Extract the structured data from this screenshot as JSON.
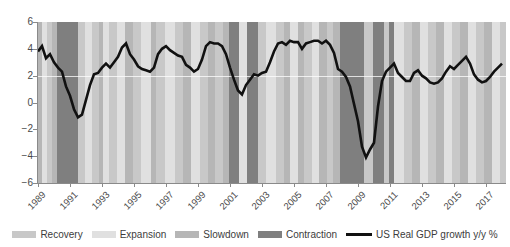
{
  "chart_data": {
    "type": "line",
    "title": "",
    "subtitle": "",
    "xlabel": "",
    "ylabel": "",
    "xlim": [
      1989.0,
      2018.25
    ],
    "ylim": [
      -6,
      6
    ],
    "yticks": [
      6,
      4,
      2,
      0,
      -2,
      -4,
      -6
    ],
    "ytick_labels": [
      "6",
      "4",
      "2",
      "0",
      "-2",
      "-4",
      "-6"
    ],
    "xticks": [
      1989,
      1991,
      1993,
      1995,
      1997,
      1999,
      2001,
      2003,
      2005,
      2007,
      2009,
      2011,
      2013,
      2015,
      2017
    ],
    "xtick_labels": [
      "1989",
      "1991",
      "1993",
      "1995",
      "1997",
      "1999",
      "2001",
      "2003",
      "2005",
      "2007",
      "2009",
      "2011",
      "2013",
      "2015",
      "2017"
    ],
    "grid": "horizontal-gridline-at-2-only",
    "legend_position": "bottom-center",
    "series": [
      {
        "name": "US Real GDP growth y/y %",
        "color": "#111111",
        "x": [
          1989.0,
          1989.25,
          1989.5,
          1989.75,
          1990.0,
          1990.25,
          1990.5,
          1990.75,
          1991.0,
          1991.25,
          1991.5,
          1991.75,
          1992.0,
          1992.25,
          1992.5,
          1992.75,
          1993.0,
          1993.25,
          1993.5,
          1993.75,
          1994.0,
          1994.25,
          1994.5,
          1994.75,
          1995.0,
          1995.25,
          1995.5,
          1995.75,
          1996.0,
          1996.25,
          1996.5,
          1996.75,
          1997.0,
          1997.25,
          1997.5,
          1997.75,
          1998.0,
          1998.25,
          1998.5,
          1998.75,
          1999.0,
          1999.25,
          1999.5,
          1999.75,
          2000.0,
          2000.25,
          2000.5,
          2000.75,
          2001.0,
          2001.25,
          2001.5,
          2001.75,
          2002.0,
          2002.25,
          2002.5,
          2002.75,
          2003.0,
          2003.25,
          2003.5,
          2003.75,
          2004.0,
          2004.25,
          2004.5,
          2004.75,
          2005.0,
          2005.25,
          2005.5,
          2005.75,
          2006.0,
          2006.25,
          2006.5,
          2006.75,
          2007.0,
          2007.25,
          2007.5,
          2007.75,
          2008.0,
          2008.25,
          2008.5,
          2008.75,
          2009.0,
          2009.25,
          2009.5,
          2009.75,
          2010.0,
          2010.25,
          2010.5,
          2010.75,
          2011.0,
          2011.25,
          2011.5,
          2011.75,
          2012.0,
          2012.25,
          2012.5,
          2012.75,
          2013.0,
          2013.25,
          2013.5,
          2013.75,
          2014.0,
          2014.25,
          2014.5,
          2014.75,
          2015.0,
          2015.25,
          2015.5,
          2015.75,
          2016.0,
          2016.25,
          2016.5,
          2016.75,
          2017.0,
          2017.25,
          2017.5,
          2017.75,
          2018.0
        ],
        "y": [
          3.8,
          4.2,
          3.3,
          3.6,
          3.0,
          2.6,
          2.3,
          1.2,
          0.5,
          -0.5,
          -1.1,
          -0.9,
          0.2,
          1.3,
          2.1,
          2.2,
          2.6,
          2.9,
          2.6,
          3.0,
          3.4,
          4.1,
          4.4,
          3.6,
          3.2,
          2.7,
          2.5,
          2.4,
          2.3,
          2.6,
          3.6,
          4.0,
          4.2,
          3.9,
          3.7,
          3.5,
          3.4,
          2.8,
          2.6,
          2.3,
          2.5,
          3.2,
          4.2,
          4.5,
          4.4,
          4.4,
          4.2,
          3.6,
          2.6,
          1.7,
          0.9,
          0.6,
          1.3,
          1.7,
          2.1,
          2.0,
          2.2,
          2.3,
          3.0,
          3.8,
          4.4,
          4.5,
          4.3,
          4.6,
          4.5,
          4.5,
          4.0,
          4.4,
          4.5,
          4.6,
          4.6,
          4.4,
          4.6,
          4.3,
          3.7,
          2.5,
          2.3,
          1.9,
          1.2,
          -0.1,
          -1.4,
          -3.3,
          -4.1,
          -3.5,
          -3.0,
          -0.3,
          1.6,
          2.3,
          2.6,
          2.9,
          2.2,
          1.9,
          1.6,
          1.6,
          2.2,
          2.4,
          2.0,
          1.8,
          1.5,
          1.4,
          1.5,
          1.8,
          2.3,
          2.7,
          2.5,
          2.8,
          3.1,
          3.4,
          2.9,
          2.1,
          1.7,
          1.5,
          1.6,
          1.9,
          2.3,
          2.6,
          2.9
        ]
      }
    ],
    "phase_bands": {
      "description": "Vertical background bands showing business cycle phase",
      "colors": {
        "Recovery": "#c8c8c8",
        "Expansion": "#e0e0e0",
        "Slowdown": "#b6b6b6",
        "Contraction": "#7f7f7f"
      },
      "bands": [
        {
          "start": 1989.0,
          "end": 1989.25,
          "phase": "Slowdown"
        },
        {
          "start": 1989.25,
          "end": 1989.55,
          "phase": "Expansion"
        },
        {
          "start": 1989.55,
          "end": 1989.9,
          "phase": "Recovery"
        },
        {
          "start": 1989.9,
          "end": 1990.2,
          "phase": "Slowdown"
        },
        {
          "start": 1990.2,
          "end": 1991.5,
          "phase": "Contraction"
        },
        {
          "start": 1991.5,
          "end": 1991.95,
          "phase": "Recovery"
        },
        {
          "start": 1991.95,
          "end": 1992.35,
          "phase": "Expansion"
        },
        {
          "start": 1992.35,
          "end": 1992.8,
          "phase": "Recovery"
        },
        {
          "start": 1992.8,
          "end": 1993.05,
          "phase": "Slowdown"
        },
        {
          "start": 1993.05,
          "end": 1993.45,
          "phase": "Expansion"
        },
        {
          "start": 1993.45,
          "end": 1993.95,
          "phase": "Recovery"
        },
        {
          "start": 1993.95,
          "end": 1994.45,
          "phase": "Expansion"
        },
        {
          "start": 1994.45,
          "end": 1994.95,
          "phase": "Slowdown"
        },
        {
          "start": 1994.95,
          "end": 1995.45,
          "phase": "Recovery"
        },
        {
          "start": 1995.45,
          "end": 1996.05,
          "phase": "Expansion"
        },
        {
          "start": 1996.05,
          "end": 1996.4,
          "phase": "Slowdown"
        },
        {
          "start": 1996.4,
          "end": 1996.95,
          "phase": "Recovery"
        },
        {
          "start": 1996.95,
          "end": 1997.55,
          "phase": "Expansion"
        },
        {
          "start": 1997.55,
          "end": 1998.05,
          "phase": "Recovery"
        },
        {
          "start": 1998.05,
          "end": 1998.55,
          "phase": "Slowdown"
        },
        {
          "start": 1998.55,
          "end": 1999.15,
          "phase": "Expansion"
        },
        {
          "start": 1999.15,
          "end": 1999.65,
          "phase": "Recovery"
        },
        {
          "start": 1999.65,
          "end": 2000.05,
          "phase": "Slowdown"
        },
        {
          "start": 2000.05,
          "end": 2000.55,
          "phase": "Recovery"
        },
        {
          "start": 2000.55,
          "end": 2000.95,
          "phase": "Slowdown"
        },
        {
          "start": 2000.95,
          "end": 2001.55,
          "phase": "Contraction"
        },
        {
          "start": 2001.55,
          "end": 2002.05,
          "phase": "Expansion"
        },
        {
          "start": 2002.05,
          "end": 2002.75,
          "phase": "Contraction"
        },
        {
          "start": 2002.75,
          "end": 2003.25,
          "phase": "Recovery"
        },
        {
          "start": 2003.25,
          "end": 2003.85,
          "phase": "Expansion"
        },
        {
          "start": 2003.85,
          "end": 2004.35,
          "phase": "Recovery"
        },
        {
          "start": 2004.35,
          "end": 2004.75,
          "phase": "Slowdown"
        },
        {
          "start": 2004.75,
          "end": 2005.25,
          "phase": "Expansion"
        },
        {
          "start": 2005.25,
          "end": 2005.65,
          "phase": "Slowdown"
        },
        {
          "start": 2005.65,
          "end": 2006.15,
          "phase": "Recovery"
        },
        {
          "start": 2006.15,
          "end": 2006.55,
          "phase": "Expansion"
        },
        {
          "start": 2006.55,
          "end": 2007.05,
          "phase": "Slowdown"
        },
        {
          "start": 2007.05,
          "end": 2007.45,
          "phase": "Recovery"
        },
        {
          "start": 2007.45,
          "end": 2007.85,
          "phase": "Slowdown"
        },
        {
          "start": 2007.85,
          "end": 2009.35,
          "phase": "Contraction"
        },
        {
          "start": 2009.35,
          "end": 2009.95,
          "phase": "Recovery"
        },
        {
          "start": 2009.95,
          "end": 2010.65,
          "phase": "Contraction"
        },
        {
          "start": 2010.65,
          "end": 2010.95,
          "phase": "Recovery"
        },
        {
          "start": 2010.95,
          "end": 2011.25,
          "phase": "Contraction"
        },
        {
          "start": 2011.25,
          "end": 2011.85,
          "phase": "Expansion"
        },
        {
          "start": 2011.85,
          "end": 2012.35,
          "phase": "Recovery"
        },
        {
          "start": 2012.35,
          "end": 2012.85,
          "phase": "Slowdown"
        },
        {
          "start": 2012.85,
          "end": 2013.35,
          "phase": "Expansion"
        },
        {
          "start": 2013.35,
          "end": 2013.85,
          "phase": "Recovery"
        },
        {
          "start": 2013.85,
          "end": 2014.35,
          "phase": "Slowdown"
        },
        {
          "start": 2014.35,
          "end": 2014.85,
          "phase": "Expansion"
        },
        {
          "start": 2014.85,
          "end": 2015.35,
          "phase": "Recovery"
        },
        {
          "start": 2015.35,
          "end": 2015.85,
          "phase": "Slowdown"
        },
        {
          "start": 2015.85,
          "end": 2016.35,
          "phase": "Expansion"
        },
        {
          "start": 2016.35,
          "end": 2016.85,
          "phase": "Recovery"
        },
        {
          "start": 2016.85,
          "end": 2017.35,
          "phase": "Slowdown"
        },
        {
          "start": 2017.35,
          "end": 2017.85,
          "phase": "Expansion"
        },
        {
          "start": 2017.85,
          "end": 2018.25,
          "phase": "Recovery"
        }
      ]
    }
  },
  "legend": {
    "items": [
      {
        "label": "Recovery",
        "kind": "swatch",
        "color": "#c8c8c8"
      },
      {
        "label": "Expansion",
        "kind": "swatch",
        "color": "#e0e0e0"
      },
      {
        "label": "Slowdown",
        "kind": "swatch",
        "color": "#b6b6b6"
      },
      {
        "label": "Contraction",
        "kind": "swatch",
        "color": "#7f7f7f"
      },
      {
        "label": "US Real GDP growth y/y %",
        "kind": "line",
        "color": "#111111"
      }
    ]
  }
}
